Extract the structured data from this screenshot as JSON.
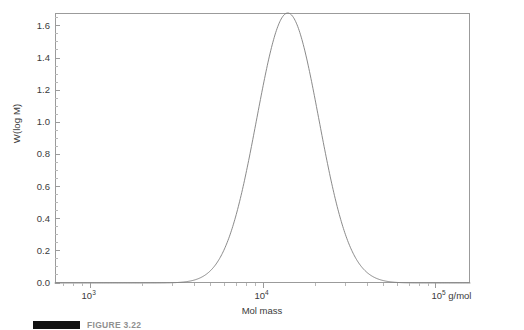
{
  "figure": {
    "caption_label": "FIGURE 3.22",
    "caption_bar_color": "#111111"
  },
  "axes": {
    "y_title": "W(log M)",
    "x_title": "Mol mass",
    "y_tick_labels": [
      "0.0",
      "0.2",
      "0.4",
      "0.6",
      "0.8",
      "1.0",
      "1.2",
      "1.4",
      "1.6"
    ],
    "y_tick_values": [
      0.0,
      0.2,
      0.4,
      0.6,
      0.8,
      1.0,
      1.2,
      1.4,
      1.6
    ],
    "x_tick_labels": [
      "10",
      "10",
      "10"
    ],
    "x_tick_exponents": [
      "3",
      "4",
      "5"
    ],
    "x_tick_values": [
      1000,
      10000,
      100000
    ],
    "x_unit": " g/mol",
    "axis_color": "#9b9b9b",
    "curve_color": "#7d7d7d"
  },
  "chart_data": {
    "type": "line",
    "title": "",
    "subtitle": "",
    "xlabel": "Mol mass",
    "ylabel": "W(log M)",
    "xscale": "log",
    "yscale": "linear",
    "xlim": [
      631,
      158489
    ],
    "ylim": [
      0.0,
      1.68
    ],
    "xticks": [
      1000,
      10000,
      100000
    ],
    "xticklabels": [
      "10^3",
      "10^4",
      "10^5 g/mol"
    ],
    "yticks": [
      0.0,
      0.2,
      0.4,
      0.6,
      0.8,
      1.0,
      1.2,
      1.4,
      1.6
    ],
    "yticklabels": [
      "0.0",
      "0.2",
      "0.4",
      "0.6",
      "0.8",
      "1.0",
      "1.2",
      "1.4",
      "1.6"
    ],
    "grid": false,
    "legend": false,
    "annotations": [],
    "series": [
      {
        "name": "W(log M)",
        "color": "#7d7d7d",
        "description": "Log-normal molar mass distribution, peak W(log M) = 1.68 at M = 14000 g/mol",
        "peak_value": 1.68,
        "peak_x": 14000,
        "x": [
          631,
          794,
          1000,
          1259,
          1585,
          1995,
          2512,
          3162,
          3981,
          5012,
          6310,
          7943,
          10000,
          12589,
          14000,
          15849,
          19953,
          25119,
          31623,
          39811,
          50119,
          63096,
          79433,
          100000,
          125893,
          158489
        ],
        "y": [
          0.002,
          0.004,
          0.008,
          0.015,
          0.028,
          0.051,
          0.09,
          0.153,
          0.25,
          0.392,
          0.585,
          0.823,
          1.208,
          1.582,
          1.68,
          1.645,
          1.376,
          0.98,
          0.61,
          0.339,
          0.175,
          0.086,
          0.041,
          0.019,
          0.009,
          0.004
        ]
      }
    ]
  }
}
